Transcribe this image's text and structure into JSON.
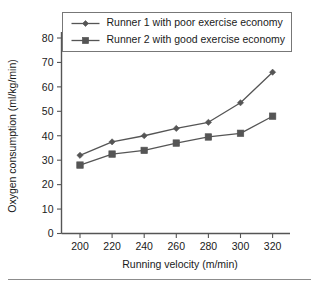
{
  "chart_data": {
    "type": "line",
    "title": "",
    "xlabel": "Running velocity (m/min)",
    "ylabel": "Oxygen consumption (ml/kg/min)",
    "x": [
      200,
      220,
      240,
      260,
      280,
      300,
      320
    ],
    "xticklabels": [
      "200",
      "220",
      "240",
      "260",
      "280",
      "300",
      "320"
    ],
    "yticklabels": [
      "0",
      "10",
      "20",
      "30",
      "40",
      "50",
      "60",
      "70",
      "80"
    ],
    "yticks": [
      0,
      10,
      20,
      30,
      40,
      50,
      60,
      70,
      80
    ],
    "xlim": [
      190,
      330
    ],
    "ylim": [
      0,
      85
    ],
    "grid": false,
    "legend_position": "top",
    "series": [
      {
        "name": "Runner 1 with poor exercise economy",
        "marker": "diamond",
        "color": "#555555",
        "values": [
          32,
          37.5,
          40,
          43,
          45.5,
          53.5,
          66
        ]
      },
      {
        "name": "Runner 2 with good exercise economy",
        "marker": "square",
        "color": "#555555",
        "values": [
          28,
          32.5,
          34,
          37,
          39.5,
          41,
          48
        ]
      }
    ]
  },
  "figure": {
    "background": "#ffffff",
    "axis_color": "#555555",
    "text_color": "#1a1a1a",
    "footer_rule_color": "#8c8c8c"
  }
}
